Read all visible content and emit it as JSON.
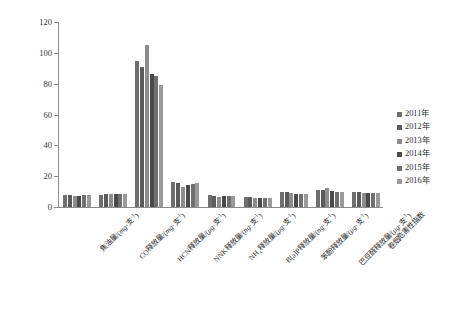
{
  "chart_data": {
    "type": "bar",
    "title": "",
    "xlabel": "",
    "ylabel": "",
    "ylim": [
      0,
      120
    ],
    "yticks": [
      0,
      20,
      40,
      60,
      80,
      100,
      120
    ],
    "grid": false,
    "legend_position": "right",
    "categories": [
      "焦油量/(mg·支⁻¹)",
      "CO释放量/(mg·支⁻¹)",
      "HCN释放量/(μg·支⁻¹)",
      "NNK释放量/(ng·支⁻¹)",
      "NH₃释放量/(μg·支⁻¹)",
      "B[a]P释放量/(ng·支⁻¹)",
      "苯酚释放量/(μg·支⁻¹)",
      "巴豆醛释放量/(μg·支⁻¹)",
      "卷烟危害性指数"
    ],
    "series": [
      {
        "name": "2011年",
        "color": "#6e6e6e",
        "values": [
          8.0,
          8.1,
          95.0,
          16.2,
          7.5,
          6.4,
          9.9,
          10.8,
          9.7
        ]
      },
      {
        "name": "2012年",
        "color": "#5b5b5b",
        "values": [
          7.9,
          8.2,
          91.0,
          15.9,
          7.3,
          6.3,
          9.8,
          10.9,
          9.6
        ]
      },
      {
        "name": "2013年",
        "color": "#8d8d8d",
        "values": [
          7.2,
          8.6,
          105.0,
          13.3,
          6.8,
          6.0,
          9.4,
          12.2,
          9.2
        ]
      },
      {
        "name": "2014年",
        "color": "#4a4a4a",
        "values": [
          7.4,
          8.6,
          86.0,
          14.6,
          7.0,
          6.0,
          8.6,
          10.3,
          9.1
        ]
      },
      {
        "name": "2015年",
        "color": "#707070",
        "values": [
          7.6,
          8.5,
          85.0,
          14.8,
          7.1,
          6.0,
          8.7,
          10.0,
          9.0
        ]
      },
      {
        "name": "2016年",
        "color": "#9a9a9a",
        "values": [
          7.5,
          8.5,
          79.0,
          15.5,
          6.9,
          5.9,
          8.6,
          9.9,
          9.0
        ]
      }
    ]
  },
  "legend": {
    "items": [
      {
        "label": "2011年"
      },
      {
        "label": "2012年"
      },
      {
        "label": "2013年"
      },
      {
        "label": "2014年"
      },
      {
        "label": "2015年"
      },
      {
        "label": "2016年"
      }
    ]
  }
}
